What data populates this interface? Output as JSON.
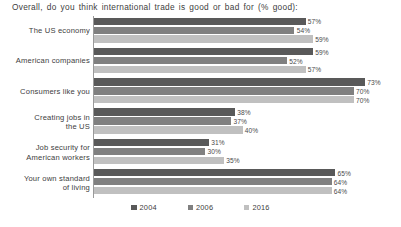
{
  "chart_data": {
    "type": "bar",
    "orientation": "horizontal",
    "title": "Overall, do you think international trade is good or bad for (% good):",
    "xlabel": "",
    "ylabel": "",
    "xlim": [
      0,
      80
    ],
    "grid": false,
    "legend_position": "bottom",
    "categories": [
      "The US economy",
      "American companies",
      "Consumers like you",
      "Creating jobs in the US",
      "Job security for American workers",
      "Your own standard of living"
    ],
    "series": [
      {
        "name": "2004",
        "color": "#595959",
        "values": [
          57,
          59,
          73,
          38,
          31,
          65
        ]
      },
      {
        "name": "2006",
        "color": "#808080",
        "values": [
          54,
          52,
          70,
          37,
          30,
          64
        ]
      },
      {
        "name": "2016",
        "color": "#c0c0c0",
        "values": [
          59,
          57,
          70,
          40,
          35,
          64
        ]
      }
    ],
    "value_suffix": "%"
  },
  "groups": [
    {
      "label_line1": "The US economy",
      "label_line2": "",
      "bars": [
        {
          "series": "2004",
          "value": 57,
          "label": "57%",
          "color": "#595959"
        },
        {
          "series": "2006",
          "value": 54,
          "label": "54%",
          "color": "#808080"
        },
        {
          "series": "2016",
          "value": 59,
          "label": "59%",
          "color": "#c0c0c0"
        }
      ]
    },
    {
      "label_line1": "American companies",
      "label_line2": "",
      "bars": [
        {
          "series": "2004",
          "value": 59,
          "label": "59%",
          "color": "#595959"
        },
        {
          "series": "2006",
          "value": 52,
          "label": "52%",
          "color": "#808080"
        },
        {
          "series": "2016",
          "value": 57,
          "label": "57%",
          "color": "#c0c0c0"
        }
      ]
    },
    {
      "label_line1": "Consumers like you",
      "label_line2": "",
      "bars": [
        {
          "series": "2004",
          "value": 73,
          "label": "73%",
          "color": "#595959"
        },
        {
          "series": "2006",
          "value": 70,
          "label": "70%",
          "color": "#808080"
        },
        {
          "series": "2016",
          "value": 70,
          "label": "70%",
          "color": "#c0c0c0"
        }
      ]
    },
    {
      "label_line1": "Creating jobs in",
      "label_line2": "the US",
      "bars": [
        {
          "series": "2004",
          "value": 38,
          "label": "38%",
          "color": "#595959"
        },
        {
          "series": "2006",
          "value": 37,
          "label": "37%",
          "color": "#808080"
        },
        {
          "series": "2016",
          "value": 40,
          "label": "40%",
          "color": "#c0c0c0"
        }
      ]
    },
    {
      "label_line1": "Job security for",
      "label_line2": "American workers",
      "bars": [
        {
          "series": "2004",
          "value": 31,
          "label": "31%",
          "color": "#595959"
        },
        {
          "series": "2006",
          "value": 30,
          "label": "30%",
          "color": "#808080"
        },
        {
          "series": "2016",
          "value": 35,
          "label": "35%",
          "color": "#c0c0c0"
        }
      ]
    },
    {
      "label_line1": "Your own standard",
      "label_line2": "of living",
      "bars": [
        {
          "series": "2004",
          "value": 65,
          "label": "65%",
          "color": "#595959"
        },
        {
          "series": "2006",
          "value": 64,
          "label": "64%",
          "color": "#808080"
        },
        {
          "series": "2016",
          "value": 64,
          "label": "64%",
          "color": "#c0c0c0"
        }
      ]
    }
  ],
  "legend": {
    "items": [
      {
        "label": "2004",
        "color": "#595959"
      },
      {
        "label": "2006",
        "color": "#808080"
      },
      {
        "label": "2016",
        "color": "#c0c0c0"
      }
    ]
  },
  "axis": {
    "max_value": 80
  }
}
